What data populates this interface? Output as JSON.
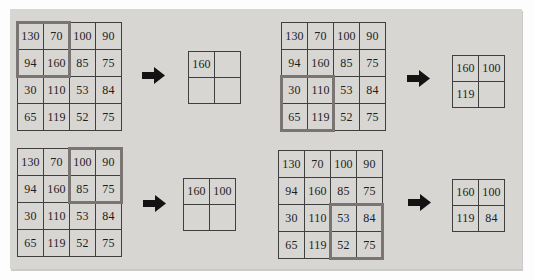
{
  "figure": {
    "name": "max-pooling-steps-diagram",
    "pool_window": "2x2",
    "stride": 2
  },
  "colors": {
    "panel_bg": "#d7d6d3",
    "cell_bg": "#d7d6d3",
    "grid_line": "#3f3f3f",
    "highlight": "#7a7572",
    "arrow": "#131313",
    "text": "#1d1d1d"
  },
  "icons": {
    "arrow": "arrow-right-icon"
  },
  "matrix": [
    [
      "130",
      "70",
      "100",
      "90"
    ],
    [
      "94",
      "160",
      "85",
      "75"
    ],
    [
      "30",
      "110",
      "53",
      "84"
    ],
    [
      "65",
      "119",
      "52",
      "75"
    ]
  ],
  "panels": [
    {
      "id": "step-window-top-left",
      "window": {
        "row": 0,
        "col": 0
      },
      "window_values": [
        [
          "130",
          "70"
        ],
        [
          "94",
          "160"
        ]
      ],
      "output": [
        [
          "160",
          ""
        ],
        [
          "",
          ""
        ]
      ]
    },
    {
      "id": "step-window-bottom-left",
      "window": {
        "row": 2,
        "col": 0
      },
      "window_values": [
        [
          "30",
          "110"
        ],
        [
          "65",
          "119"
        ]
      ],
      "output": [
        [
          "160",
          "100"
        ],
        [
          "119",
          ""
        ]
      ]
    },
    {
      "id": "step-window-top-right",
      "window": {
        "row": 0,
        "col": 2
      },
      "window_values": [
        [
          "100",
          "90"
        ],
        [
          "85",
          "75"
        ]
      ],
      "output": [
        [
          "160",
          "100"
        ],
        [
          "",
          ""
        ]
      ]
    },
    {
      "id": "step-window-bottom-right",
      "window": {
        "row": 2,
        "col": 2
      },
      "window_values": [
        [
          "53",
          "84"
        ],
        [
          "52",
          "75"
        ]
      ],
      "output": [
        [
          "160",
          "100"
        ],
        [
          "119",
          "84"
        ]
      ]
    }
  ]
}
